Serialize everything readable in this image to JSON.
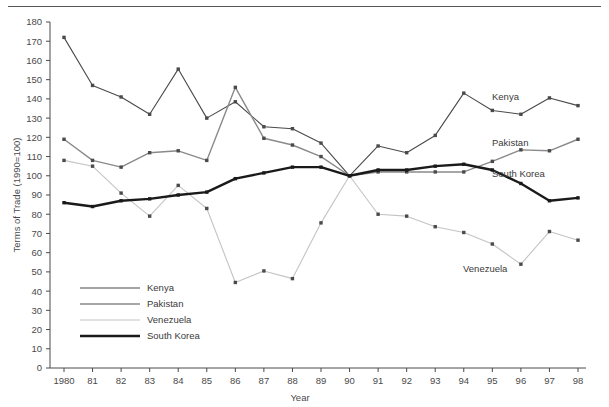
{
  "chart_data": {
    "type": "line",
    "title": "",
    "xlabel": "Year",
    "ylabel": "Terms of Trade (1990=100)",
    "xlim": [
      1980,
      1998
    ],
    "ylim": [
      0,
      180
    ],
    "ytick_step": 10,
    "grid": false,
    "legend_position": "inside-lower-left",
    "x": [
      1980,
      1981,
      1982,
      1983,
      1984,
      1985,
      1986,
      1987,
      1988,
      1989,
      1990,
      1991,
      1992,
      1993,
      1994,
      1995,
      1996,
      1997,
      1998
    ],
    "xtick_labels": [
      "1980",
      "81",
      "82",
      "83",
      "84",
      "85",
      "86",
      "87",
      "88",
      "89",
      "90",
      "91",
      "92",
      "93",
      "94",
      "95",
      "96",
      "97",
      "98"
    ],
    "ytick_labels": [
      "0",
      "10",
      "20",
      "30",
      "40",
      "50",
      "60",
      "70",
      "80",
      "90",
      "100",
      "110",
      "120",
      "130",
      "140",
      "150",
      "160",
      "170",
      "180"
    ],
    "series": [
      {
        "name": "Kenya",
        "color": "#4a4a4a",
        "width": 1.1,
        "end_label": "Kenya",
        "values": [
          172,
          147,
          141,
          132,
          155.5,
          130,
          138.5,
          125.5,
          124.5,
          117,
          100,
          115.5,
          112,
          121,
          143,
          134,
          132,
          140.5,
          136.5
        ]
      },
      {
        "name": "Pakistan",
        "color": "#8a8a8a",
        "width": 1.4,
        "end_label": "Pakistan",
        "values": [
          119,
          108,
          104.5,
          112,
          113,
          108,
          146,
          119.5,
          116,
          110,
          100,
          102,
          102,
          102,
          102,
          107.5,
          113.5,
          113,
          119
        ]
      },
      {
        "name": "Venezuela",
        "color": "#c4c4c4",
        "width": 1.1,
        "end_label": "Venezuela",
        "values": [
          108,
          105,
          91,
          79,
          95,
          83,
          44.5,
          50.5,
          46.5,
          75.5,
          100,
          80,
          79,
          73.5,
          70.5,
          64.5,
          54,
          71,
          66.5
        ]
      },
      {
        "name": "South Korea",
        "color": "#1a1a1a",
        "width": 2.4,
        "end_label": "South Korea",
        "values": [
          86,
          84,
          87,
          88,
          90,
          91.5,
          98.5,
          101.5,
          104.5,
          104.5,
          100,
          103,
          103,
          105,
          106,
          103,
          96,
          87,
          88.5
        ]
      }
    ]
  },
  "legend": {
    "items": [
      {
        "label": "Kenya"
      },
      {
        "label": "Pakistan"
      },
      {
        "label": "Venezuela"
      },
      {
        "label": "South Korea"
      }
    ]
  }
}
